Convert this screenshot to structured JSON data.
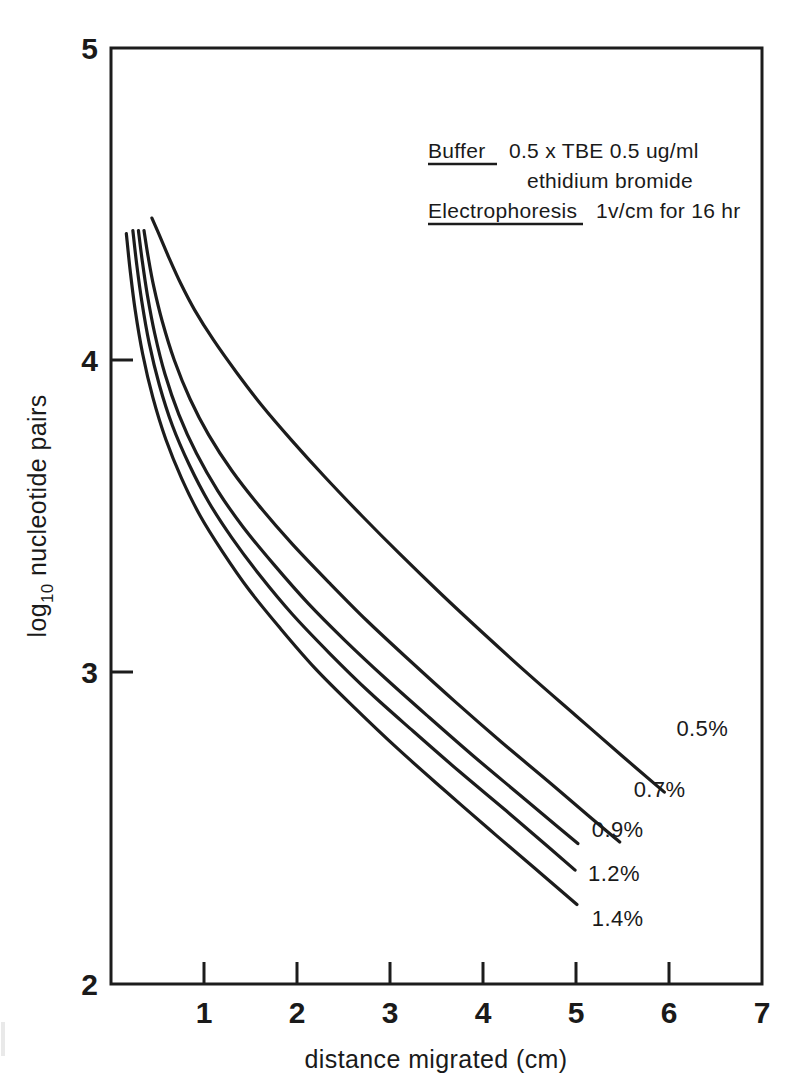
{
  "figure": {
    "background_color": "#ffffff",
    "ink_color": "#1c1c1c"
  },
  "chart_data": {
    "type": "line",
    "title": "",
    "xlabel": "distance migrated (cm)",
    "ylabel_main": "nucleotide pairs",
    "ylabel_prefix": "log",
    "ylabel_subscript": "10",
    "xlim": [
      0,
      7
    ],
    "ylim": [
      2,
      5
    ],
    "xticks": [
      1,
      2,
      3,
      4,
      5,
      6,
      7
    ],
    "xtick_labels": [
      "1",
      "2",
      "3",
      "4",
      "5",
      "6",
      "7"
    ],
    "yticks": [
      2,
      3,
      4,
      5
    ],
    "ytick_labels": [
      "2",
      "3",
      "4",
      "5"
    ],
    "grid": false,
    "legend_position": "inline-right-end-of-curve",
    "series": [
      {
        "name": "0.5%",
        "label": "0.5%",
        "label_x": 6.08,
        "label_y": 2.795,
        "points": [
          [
            0.44,
            4.455
          ],
          [
            0.52,
            4.4
          ],
          [
            0.62,
            4.33
          ],
          [
            0.75,
            4.245
          ],
          [
            0.9,
            4.16
          ],
          [
            1.1,
            4.065
          ],
          [
            1.35,
            3.96
          ],
          [
            1.62,
            3.855
          ],
          [
            1.95,
            3.74
          ],
          [
            2.3,
            3.625
          ],
          [
            2.7,
            3.5
          ],
          [
            3.1,
            3.38
          ],
          [
            3.55,
            3.25
          ],
          [
            4.0,
            3.125
          ],
          [
            4.5,
            2.99
          ],
          [
            5.0,
            2.86
          ],
          [
            5.5,
            2.73
          ],
          [
            5.95,
            2.615
          ]
        ]
      },
      {
        "name": "0.7%",
        "label": "0.7%",
        "label_x": 5.62,
        "label_y": 2.598,
        "points": [
          [
            0.355,
            4.415
          ],
          [
            0.4,
            4.33
          ],
          [
            0.46,
            4.235
          ],
          [
            0.55,
            4.125
          ],
          [
            0.68,
            4.0
          ],
          [
            0.85,
            3.875
          ],
          [
            1.05,
            3.76
          ],
          [
            1.3,
            3.645
          ],
          [
            1.6,
            3.53
          ],
          [
            1.95,
            3.41
          ],
          [
            2.35,
            3.285
          ],
          [
            2.75,
            3.165
          ],
          [
            3.2,
            3.04
          ],
          [
            3.7,
            2.905
          ],
          [
            4.2,
            2.775
          ],
          [
            4.7,
            2.65
          ],
          [
            5.15,
            2.535
          ],
          [
            5.47,
            2.455
          ]
        ]
      },
      {
        "name": "0.9%",
        "label": "0.9%",
        "label_x": 5.17,
        "label_y": 2.47,
        "points": [
          [
            0.295,
            4.415
          ],
          [
            0.335,
            4.32
          ],
          [
            0.39,
            4.21
          ],
          [
            0.47,
            4.085
          ],
          [
            0.58,
            3.955
          ],
          [
            0.73,
            3.825
          ],
          [
            0.92,
            3.7
          ],
          [
            1.15,
            3.58
          ],
          [
            1.42,
            3.465
          ],
          [
            1.75,
            3.345
          ],
          [
            2.12,
            3.22
          ],
          [
            2.52,
            3.1
          ],
          [
            2.95,
            2.98
          ],
          [
            3.42,
            2.855
          ],
          [
            3.9,
            2.73
          ],
          [
            4.38,
            2.61
          ],
          [
            4.8,
            2.505
          ],
          [
            5.02,
            2.45
          ]
        ]
      },
      {
        "name": "1.2%",
        "label": "1.2%",
        "label_x": 5.13,
        "label_y": 2.33,
        "points": [
          [
            0.235,
            4.415
          ],
          [
            0.275,
            4.31
          ],
          [
            0.33,
            4.19
          ],
          [
            0.41,
            4.055
          ],
          [
            0.52,
            3.92
          ],
          [
            0.66,
            3.79
          ],
          [
            0.84,
            3.665
          ],
          [
            1.05,
            3.545
          ],
          [
            1.3,
            3.43
          ],
          [
            1.6,
            3.31
          ],
          [
            1.95,
            3.185
          ],
          [
            2.35,
            3.06
          ],
          [
            2.78,
            2.935
          ],
          [
            3.25,
            2.81
          ],
          [
            3.75,
            2.68
          ],
          [
            4.25,
            2.555
          ],
          [
            4.7,
            2.44
          ],
          [
            4.99,
            2.365
          ]
        ]
      },
      {
        "name": "1.4%",
        "label": "1.4%",
        "label_x": 5.17,
        "label_y": 2.185,
        "points": [
          [
            0.165,
            4.405
          ],
          [
            0.205,
            4.29
          ],
          [
            0.26,
            4.16
          ],
          [
            0.34,
            4.02
          ],
          [
            0.45,
            3.88
          ],
          [
            0.59,
            3.745
          ],
          [
            0.76,
            3.62
          ],
          [
            0.96,
            3.5
          ],
          [
            1.2,
            3.385
          ],
          [
            1.48,
            3.265
          ],
          [
            1.82,
            3.14
          ],
          [
            2.2,
            3.01
          ],
          [
            2.62,
            2.885
          ],
          [
            3.08,
            2.755
          ],
          [
            3.57,
            2.625
          ],
          [
            4.07,
            2.495
          ],
          [
            4.56,
            2.37
          ],
          [
            5.01,
            2.255
          ]
        ]
      }
    ],
    "annotations": [
      {
        "id": "buffer",
        "heading": "Buffer",
        "heading_underlined": true,
        "lines": [
          "0.5 x TBE  0.5 ug/ml",
          "ethidium bromide"
        ]
      },
      {
        "id": "electrophoresis",
        "heading": "Electrophoresis",
        "heading_underlined": true,
        "lines": [
          "1v/cm for 16 hr"
        ]
      }
    ]
  }
}
